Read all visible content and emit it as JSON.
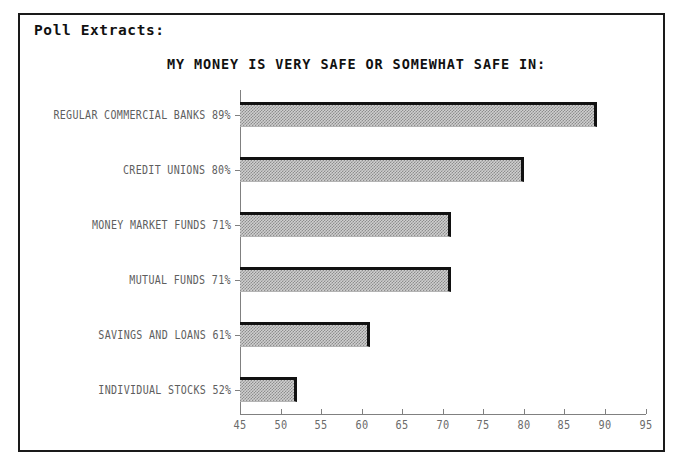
{
  "panel": {
    "header": "Poll Extracts:"
  },
  "chart_data": {
    "type": "bar",
    "orientation": "horizontal",
    "title": "MY MONEY IS VERY SAFE OR SOMEWHAT SAFE IN:",
    "xlabel": "",
    "ylabel": "",
    "xlim": [
      45,
      95
    ],
    "grid": false,
    "legend": null,
    "categories": [
      "REGULAR COMMERCIAL BANKS",
      "CREDIT UNIONS",
      "MONEY MARKET FUNDS",
      "MUTUAL FUNDS",
      "SAVINGS AND LOANS",
      "INDIVIDUAL STOCKS"
    ],
    "values": [
      89,
      80,
      71,
      71,
      61,
      52
    ],
    "category_labels": [
      "REGULAR COMMERCIAL BANKS 89%",
      "CREDIT UNIONS 80%",
      "MONEY MARKET FUNDS 71%",
      "MUTUAL FUNDS 71%",
      "SAVINGS AND LOANS 61%",
      "INDIVIDUAL STOCKS 52%"
    ],
    "xticks": [
      45,
      50,
      55,
      60,
      65,
      70,
      75,
      80,
      85,
      90,
      95
    ],
    "xtick_labels": [
      "45",
      "50",
      "55",
      "60",
      "65",
      "70",
      "75",
      "80",
      "85",
      "90",
      "95"
    ],
    "colors": {
      "bar_fill": "#cfcfcf",
      "bar_hatch": "#8d8d8d",
      "bar_edge": "#111111",
      "axis": "#808080",
      "label_text": "#5e5e5e",
      "title_text": "#111111",
      "frame": "#1a1a1a",
      "background": "#ffffff"
    }
  }
}
